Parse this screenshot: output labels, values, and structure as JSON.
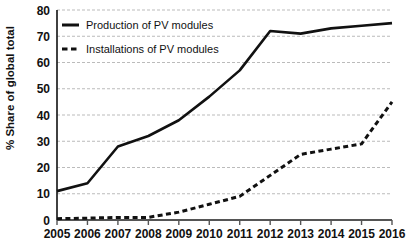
{
  "chart_data": {
    "type": "line",
    "title": "",
    "xlabel": "",
    "ylabel": "% Share of global total",
    "categories": [
      "2005",
      "2006",
      "2007",
      "2008",
      "2009",
      "2010",
      "2011",
      "2012",
      "2013",
      "2014",
      "2015",
      "2016"
    ],
    "x": [
      2005,
      2006,
      2007,
      2008,
      2009,
      2010,
      2011,
      2012,
      2013,
      2014,
      2015,
      2016
    ],
    "xlim": [
      2005,
      2016
    ],
    "ylim": [
      0,
      80
    ],
    "yticks": [
      0,
      10,
      20,
      30,
      40,
      50,
      60,
      70,
      80
    ],
    "ytick_labels": [
      "0",
      "10",
      "20",
      "30",
      "40",
      "50",
      "60",
      "70",
      "80"
    ],
    "grid": true,
    "grid_style": "dotted-horizontal",
    "grid_color": "#bbbbbb",
    "legend_position": "top-left-inside",
    "series": [
      {
        "name": "Production of PV modules",
        "style": "solid",
        "color": "#111111",
        "values": [
          11,
          14,
          28,
          32,
          38,
          47,
          57,
          72,
          71,
          73,
          74,
          75
        ]
      },
      {
        "name": "Installations of PV modules",
        "style": "dashed",
        "color": "#111111",
        "values": [
          0.5,
          0.7,
          1,
          1,
          3,
          6,
          9,
          17,
          25,
          27,
          29,
          45
        ]
      }
    ]
  },
  "legend": {
    "items": [
      {
        "label": "Production of PV modules",
        "marker": "solid-line-marker"
      },
      {
        "label": "Installations of PV modules",
        "marker": "dashed-line-marker"
      }
    ]
  },
  "axes": {
    "y_title": "% Share of global total"
  }
}
